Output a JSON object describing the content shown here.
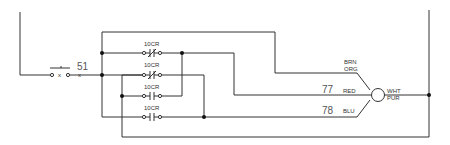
{
  "diagram": {
    "type": "electrical-ladder-schematic",
    "switch": {
      "label": "51"
    },
    "contacts": [
      {
        "label": "10CR",
        "kind": "normally-closed",
        "row": 1
      },
      {
        "label": "10CR",
        "kind": "normally-closed",
        "row": 2
      },
      {
        "label": "10CR",
        "kind": "normally-open",
        "row": 3
      },
      {
        "label": "10CR",
        "kind": "normally-open",
        "row": 4
      }
    ],
    "wires": {
      "red_number": "77",
      "blu_number": "78"
    },
    "motor": {
      "lead_top_1": "BRN",
      "lead_top_2": "ORG",
      "lead_mid": "RED",
      "lead_bot": "BLU",
      "out_1": "WHT",
      "out_2": "PUR"
    },
    "colors": {
      "line": "#333333",
      "background": "#ffffff"
    }
  }
}
